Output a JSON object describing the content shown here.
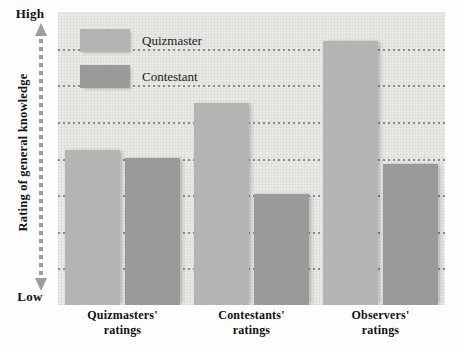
{
  "chart_data": {
    "type": "bar",
    "title": "",
    "xlabel": "",
    "ylabel": "Rating of general knowledge",
    "categories": [
      "Quizmasters' ratings",
      "Contestants' ratings",
      "Observers' ratings"
    ],
    "series": [
      {
        "name": "Quizmaster",
        "color": "#b4b4b3",
        "values": [
          53,
          69,
          90
        ]
      },
      {
        "name": "Contestant",
        "color": "#9a9a99",
        "values": [
          50,
          38,
          48
        ]
      }
    ],
    "ylim": [
      0,
      100
    ],
    "y_axis_min_label": "Low",
    "y_axis_max_label": "High",
    "grid": true,
    "gridline_count": 7,
    "legend_position": "top-left-inside",
    "background_color": "#e9e9e6",
    "gridline_color": "#6d6d6d"
  },
  "axis": {
    "y_title": "Rating of general knowledge",
    "y_high": "High",
    "y_low": "Low"
  },
  "legend": {
    "items": [
      {
        "label": "Quizmaster",
        "color": "#b4b4b3"
      },
      {
        "label": "Contestant",
        "color": "#9a9a99"
      }
    ]
  },
  "x_labels": [
    {
      "line1": "Quizmasters'",
      "line2": "ratings"
    },
    {
      "line1": "Contestants'",
      "line2": "ratings"
    },
    {
      "line1": "Observers'",
      "line2": "ratings"
    }
  ]
}
